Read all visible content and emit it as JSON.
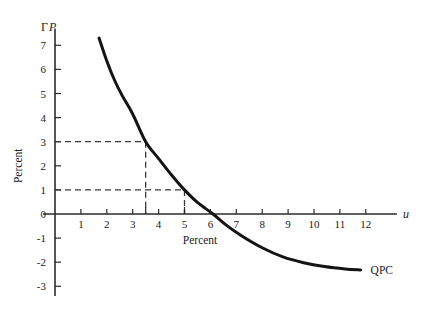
{
  "chart_data": {
    "type": "line",
    "title": "",
    "subtitle": "",
    "xlabel": "Percent",
    "ylabel": "Percent",
    "x_axis_symbol": "u",
    "y_axis_symbol_gamma": "Γ",
    "y_axis_symbol_p": "P",
    "xlim": [
      0,
      13.2
    ],
    "ylim": [
      -3.4,
      7.7
    ],
    "grid": false,
    "legend_position": "inline-right",
    "x_ticks": [
      1,
      2,
      3,
      4,
      5,
      6,
      7,
      8,
      9,
      10,
      11,
      12
    ],
    "x_tick_labels": [
      "1",
      "2",
      "3",
      "4",
      "5",
      "6",
      "7",
      "8",
      "9",
      "10",
      "11",
      "12"
    ],
    "y_ticks": [
      7,
      6,
      5,
      4,
      3,
      2,
      1,
      0,
      -1,
      -2,
      -3
    ],
    "y_tick_labels": [
      "7",
      "6",
      "5",
      "4",
      "3",
      "2",
      "1",
      "0",
      "-1",
      "-2",
      "-3"
    ],
    "series": [
      {
        "name": "QPC",
        "label": "QPC",
        "color": "#141414",
        "line_width": 3.0,
        "x": [
          1.7,
          2.0,
          2.3,
          2.6,
          3.0,
          3.5,
          4.0,
          4.5,
          5.0,
          5.5,
          6.1,
          6.6,
          7.2,
          8.0,
          8.8,
          9.6,
          10.4,
          11.2,
          11.8
        ],
        "y": [
          7.3,
          6.35,
          5.55,
          4.9,
          4.15,
          3.0,
          2.3,
          1.62,
          1.0,
          0.48,
          0.0,
          -0.45,
          -0.9,
          -1.4,
          -1.78,
          -2.02,
          -2.18,
          -2.28,
          -2.32
        ]
      }
    ],
    "annotations": [
      {
        "name": "guide-3-percent",
        "type": "dashed-guide",
        "y_value": 3,
        "x_value": 3.5,
        "description": "horizontal dashed line at inflation 3% meeting curve, vertical dashed drop to u = 3.5"
      },
      {
        "name": "guide-1-percent",
        "type": "dashed-guide",
        "y_value": 1,
        "x_value": 5.0,
        "description": "horizontal dashed line at inflation 1% meeting curve, vertical dashed drop to u = 5"
      }
    ],
    "zero_crossing_x": 6.1,
    "asymptote_y": -2.32
  },
  "labels": {
    "curve_name": "QPC",
    "x_axis_title": "Percent",
    "y_axis_title": "Percent",
    "x_axis_variable": "u",
    "y_axis_gamma": "Γ",
    "y_axis_price": "P"
  },
  "colors": {
    "curve": "#141414",
    "axis": "#2b2b2b",
    "guide": "#3a3a3a",
    "text": "#1a1a1a",
    "background": "#ffffff"
  }
}
